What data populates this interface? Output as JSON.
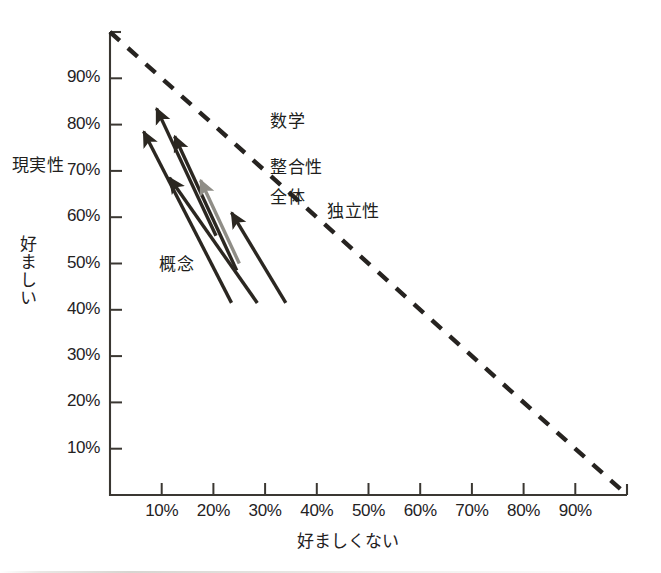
{
  "chart_data": {
    "type": "scatter",
    "title": "",
    "xlabel": "好ましくない",
    "ylabel": "好ましい",
    "xlim": [
      0,
      100
    ],
    "ylim": [
      0,
      100
    ],
    "grid": false,
    "legend_position": "inline-annotations",
    "xticks": [
      "10%",
      "20%",
      "30%",
      "40%",
      "50%",
      "60%",
      "70%",
      "80%",
      "90%"
    ],
    "xtick_values": [
      10,
      20,
      30,
      40,
      50,
      60,
      70,
      80,
      90
    ],
    "yticks": [
      "10%",
      "20%",
      "30%",
      "40%",
      "50%",
      "60%",
      "70%",
      "80%",
      "90%"
    ],
    "ytick_values": [
      10,
      20,
      30,
      40,
      50,
      60,
      70,
      80,
      90
    ],
    "reference_line": {
      "name": "sum-to-100-percent-line",
      "style": "dashed",
      "color": "#262320",
      "from": [
        0,
        100
      ],
      "to": [
        100,
        0
      ]
    },
    "annotations": [
      {
        "id": "mathematics",
        "label": "数学",
        "color": "#2b2721",
        "from_x": 20.5,
        "from_y": 56.0,
        "to_x": 9.0,
        "to_y": 83.5,
        "label_x": 31.0,
        "label_y": 81.5
      },
      {
        "id": "reality",
        "label": "現実性",
        "color": "#2b2721",
        "from_x": 23.5,
        "from_y": 41.5,
        "to_x": 6.5,
        "to_y": 78.5,
        "label_x": -19.0,
        "label_y": 72.0
      },
      {
        "id": "consistency",
        "label": "整合性",
        "color": "#2b2721",
        "from_x": 24.5,
        "from_y": 48.5,
        "to_x": 12.5,
        "to_y": 77.5,
        "label_x": 31.0,
        "label_y": 71.5
      },
      {
        "id": "whole",
        "label": "全体",
        "color": "#8f8d86",
        "from_x": 25.0,
        "from_y": 50.0,
        "to_x": 17.5,
        "to_y": 68.0,
        "label_x": 31.0,
        "label_y": 65.0
      },
      {
        "id": "concept",
        "label": "概念",
        "color": "#2b2721",
        "from_x": 28.5,
        "from_y": 41.5,
        "to_x": 11.5,
        "to_y": 68.5,
        "label_x": 9.5,
        "label_y": 50.5
      },
      {
        "id": "independence",
        "label": "独立性",
        "color": "#2b2721",
        "from_x": 34.0,
        "from_y": 41.5,
        "to_x": 23.5,
        "to_y": 61.0,
        "label_x": 42.0,
        "label_y": 62.0
      }
    ]
  },
  "axes": {
    "x_title": "好ましくない",
    "y_title": "好ましい"
  }
}
